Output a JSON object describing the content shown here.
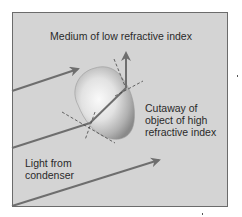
{
  "diagram": {
    "labels": {
      "medium": "Medium of low refractive index",
      "object_line1": "Cutaway of",
      "object_line2": "object of high",
      "object_line3": "refractive index",
      "light_line1": "Light from",
      "light_line2": "condenser"
    },
    "colors": {
      "background": "#d4d4d4",
      "border": "#6b6b6b",
      "ray": "#6e6e6e",
      "object_light": "#f4f4f4",
      "object_dark": "#8a8a8a",
      "text": "#2a2a2a"
    },
    "elements": [
      "incident-ray-upper",
      "incident-ray-through-object",
      "refracted-ray-inside-object",
      "exit-ray-vertical",
      "incident-ray-lower",
      "object-blob",
      "normal-line-entry",
      "tangent-line-entry",
      "normal-line-exit",
      "tangent-line-exit"
    ]
  }
}
